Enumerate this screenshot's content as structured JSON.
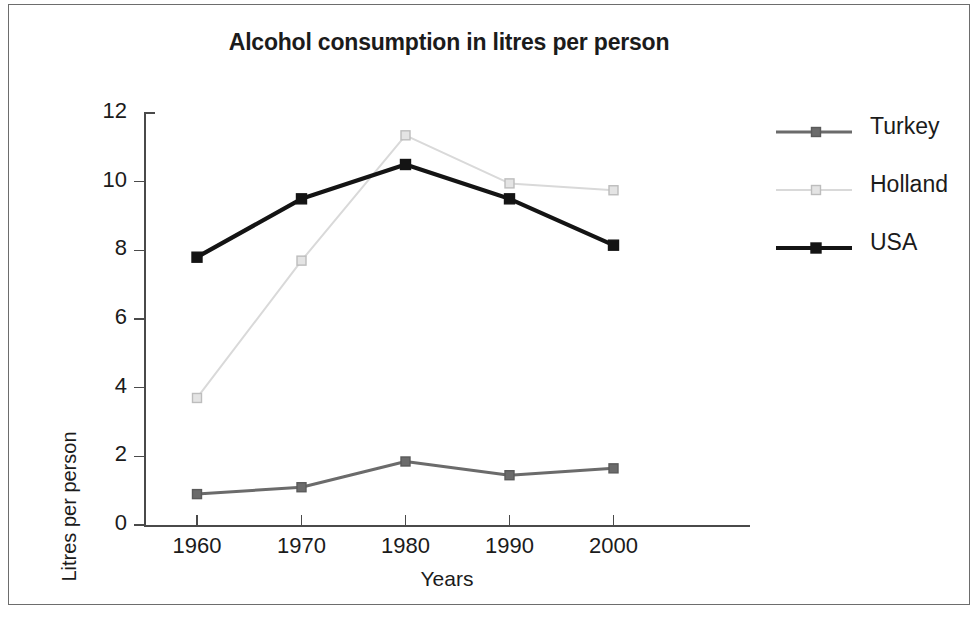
{
  "chart_data": {
    "type": "line",
    "title": "Alcohol consumption in litres per person",
    "xlabel": "Years",
    "ylabel": "Litres per person",
    "categories": [
      "1960",
      "1970",
      "1980",
      "1990",
      "2000"
    ],
    "x": [
      1960,
      1970,
      1980,
      1990,
      2000
    ],
    "xlim": [
      1955,
      2005
    ],
    "ylim": [
      0,
      12
    ],
    "yticks": [
      0,
      2,
      4,
      6,
      8,
      10,
      12
    ],
    "grid": false,
    "legend_position": "right",
    "series": [
      {
        "name": "Turkey",
        "color": "#6b6b6b",
        "marker": "square-filled",
        "values": [
          0.9,
          1.1,
          1.85,
          1.45,
          1.65
        ]
      },
      {
        "name": "Holland",
        "color": "#d9d9d9",
        "marker": "square-open",
        "values": [
          3.7,
          7.7,
          11.35,
          9.95,
          9.75
        ]
      },
      {
        "name": "USA",
        "color": "#141414",
        "marker": "square-filled",
        "values": [
          7.8,
          9.5,
          10.5,
          9.5,
          8.15
        ]
      }
    ]
  },
  "legend": {
    "items": [
      {
        "label": "Turkey"
      },
      {
        "label": "Holland"
      },
      {
        "label": "USA"
      }
    ]
  },
  "axes": {
    "y_tick_labels": [
      "12",
      "10",
      "8",
      "6",
      "4",
      "2",
      "0"
    ],
    "x_tick_labels": [
      "1960",
      "1970",
      "1980",
      "1990",
      "2000"
    ]
  },
  "colors": {
    "turkey": "#6b6b6b",
    "holland": "#d9d9d9",
    "usa": "#141414",
    "axis": "#4a4a4a",
    "text": "#1b1b1b",
    "border": "#6d6d6d"
  }
}
